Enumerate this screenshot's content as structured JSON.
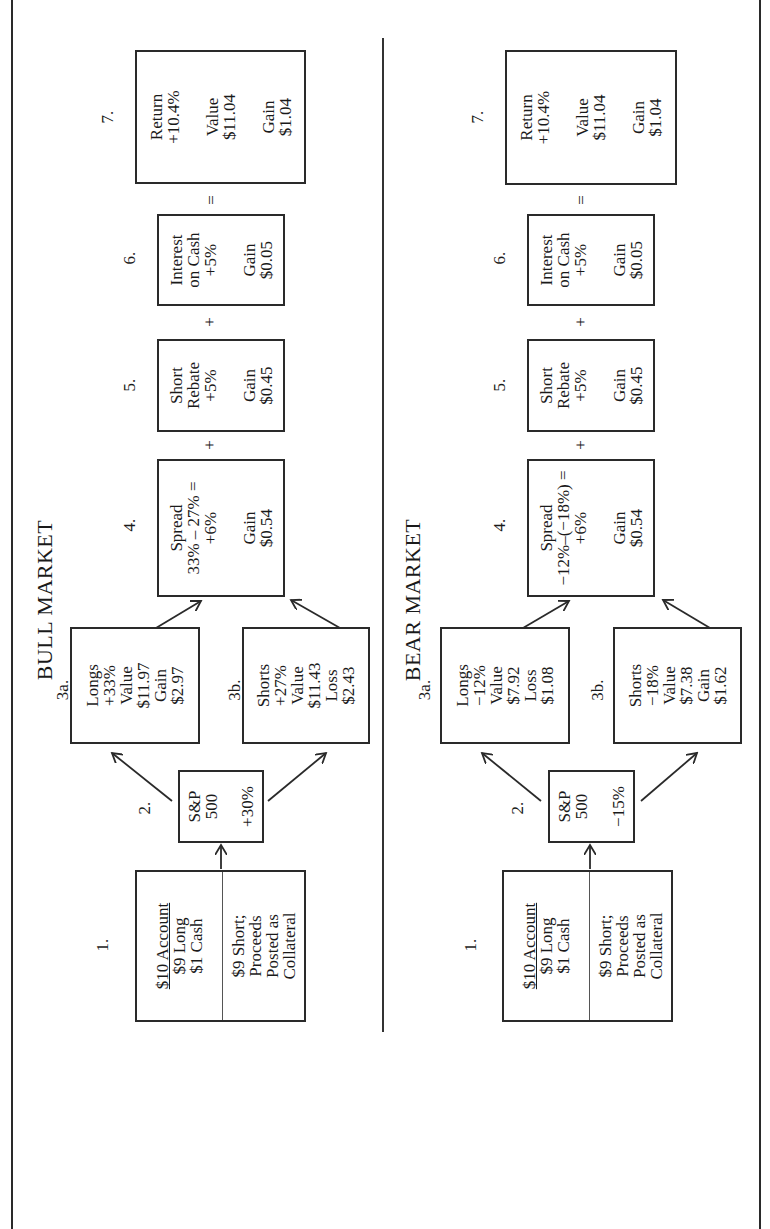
{
  "panels": [
    {
      "title": "BULL MARKET",
      "step1": {
        "label": "1.",
        "heading": "$10 Account",
        "lines_top": [
          "$9 Long",
          "$1 Cash"
        ],
        "lines_bottom": [
          "$9 Short;",
          "Proceeds",
          "Posted as",
          "Collateral"
        ]
      },
      "step2": {
        "label": "2.",
        "lines": [
          "S&P",
          "500"
        ],
        "change": "+30%"
      },
      "step3a": {
        "label": "3a.",
        "lines": [
          "Longs",
          "+33%",
          "Value",
          "$11.97",
          "Gain",
          "$2.97"
        ]
      },
      "step3b": {
        "label": "3b.",
        "lines": [
          "Shorts",
          "+27%",
          "Value",
          "$11.43",
          "Loss",
          "$2.43"
        ]
      },
      "step4": {
        "label": "4.",
        "lines": [
          "Spread",
          "33% – 27% =",
          "+6%"
        ],
        "result": [
          "Gain",
          "$0.54"
        ]
      },
      "op45": "+",
      "step5": {
        "label": "5.",
        "lines": [
          "Short",
          "Rebate",
          "+5%"
        ],
        "result": [
          "Gain",
          "$0.45"
        ]
      },
      "op56": "+",
      "step6": {
        "label": "6.",
        "lines": [
          "Interest",
          "on Cash",
          "+5%"
        ],
        "result": [
          "Gain",
          "$0.05"
        ]
      },
      "op67": "=",
      "step7": {
        "label": "7.",
        "lines": [
          "Return",
          "+10.4%"
        ],
        "value": [
          "Value",
          "$11.04"
        ],
        "gain": [
          "Gain",
          "$1.04"
        ]
      }
    },
    {
      "title": "BEAR MARKET",
      "step1": {
        "label": "1.",
        "heading": "$10 Account",
        "lines_top": [
          "$9 Long",
          "$1 Cash"
        ],
        "lines_bottom": [
          "$9 Short;",
          "Proceeds",
          "Posted as",
          "Collateral"
        ]
      },
      "step2": {
        "label": "2.",
        "lines": [
          "S&P",
          "500"
        ],
        "change": "−15%"
      },
      "step3a": {
        "label": "3a.",
        "lines": [
          "Longs",
          "−12%",
          "Value",
          "$7.92",
          "Loss",
          "$1.08"
        ]
      },
      "step3b": {
        "label": "3b.",
        "lines": [
          "Shorts",
          "−18%",
          "Value",
          "$7.38",
          "Gain",
          "$1.62"
        ]
      },
      "step4": {
        "label": "4.",
        "lines": [
          "Spread",
          "−12%–(−18%) =",
          "+6%"
        ],
        "result": [
          "Gain",
          "$0.54"
        ]
      },
      "op45": "+",
      "step5": {
        "label": "5.",
        "lines": [
          "Short",
          "Rebate",
          "+5%"
        ],
        "result": [
          "Gain",
          "$0.45"
        ]
      },
      "op56": "+",
      "step6": {
        "label": "6.",
        "lines": [
          "Interest",
          "on Cash",
          "+5%"
        ],
        "result": [
          "Gain",
          "$0.05"
        ]
      },
      "op67": "=",
      "step7": {
        "label": "7.",
        "lines": [
          "Return",
          "+10.4%"
        ],
        "value": [
          "Value",
          "$11.04"
        ],
        "gain": [
          "Gain",
          "$1.04"
        ]
      }
    }
  ],
  "colors": {
    "line": "#2a2a2a",
    "text": "#1a1a1a",
    "background": "#ffffff"
  }
}
